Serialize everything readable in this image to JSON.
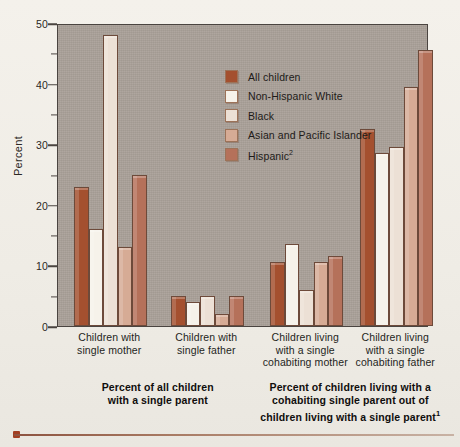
{
  "chart_data": {
    "type": "bar",
    "title": "",
    "xlabel": "",
    "ylabel": "Percent",
    "ylim": [
      0,
      50
    ],
    "yticks": [
      0,
      10,
      20,
      30,
      40,
      50
    ],
    "yticks_minor": [
      5,
      15,
      25,
      35,
      45
    ],
    "grid": false,
    "legend_position": "inside-top-center",
    "categories": [
      "Children with single mother",
      "Children with single father",
      "Children living with a single cohabiting mother",
      "Children living with a single cohabiting father"
    ],
    "category_lines": [
      [
        "Children with",
        "single mother"
      ],
      [
        "Children with",
        "single father"
      ],
      [
        "Children living",
        "with a single",
        "cohabiting mother"
      ],
      [
        "Children living",
        "with a single",
        "cohabiting father"
      ]
    ],
    "series": [
      {
        "name": "All children",
        "color": "#a4502f",
        "values": [
          23.0,
          5.0,
          10.5,
          32.5
        ]
      },
      {
        "name": "Non-Hispanic White",
        "color": "#f6f2ea",
        "values": [
          16.0,
          4.0,
          13.5,
          28.5
        ]
      },
      {
        "name": "Black",
        "color": "#ece0d5",
        "values": [
          48.0,
          5.0,
          6.0,
          29.5
        ]
      },
      {
        "name": "Asian and Pacific Islander",
        "color": "#d6ab95",
        "values": [
          13.0,
          2.0,
          10.5,
          39.5
        ]
      },
      {
        "name": "Hispanic",
        "color": "#b5715a",
        "values": [
          25.0,
          5.0,
          11.5,
          45.5
        ]
      }
    ],
    "legend_entries": [
      {
        "label": "All children",
        "superscript": ""
      },
      {
        "label": "Non-Hispanic White",
        "superscript": ""
      },
      {
        "label": "Black",
        "superscript": ""
      },
      {
        "label": "Asian and Pacific Islander",
        "superscript": ""
      },
      {
        "label": "Hispanic",
        "superscript": "2"
      }
    ],
    "section_captions": [
      {
        "lines": [
          "Percent of all children",
          "with a single parent"
        ],
        "superscript": ""
      },
      {
        "lines": [
          "Percent of children living with a",
          "cohabiting single parent out of",
          "children living with a single parent"
        ],
        "superscript": "1"
      }
    ],
    "colors": {
      "plot_background": "#a9a098",
      "page_background": "#f2efe9",
      "axis": "#4a4440",
      "text": "#241f1c",
      "rule": "#8d5340",
      "rule_dot": "#a23e22"
    }
  }
}
